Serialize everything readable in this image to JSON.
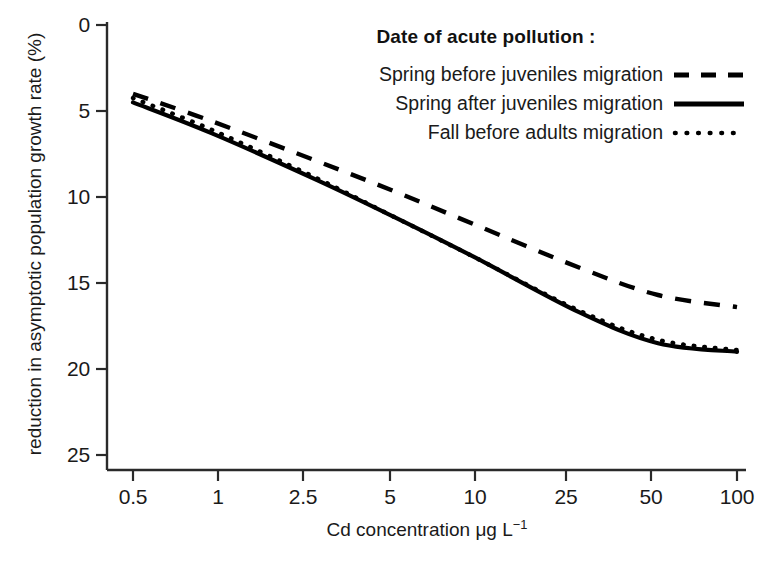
{
  "chart_data": {
    "type": "line",
    "title": "",
    "xlabel": "Cd concentration μg L⁻¹",
    "xlabel_base": "Cd concentration μg L",
    "xlabel_exponent": "−1",
    "ylabel": "reduction in asymptotic population growth rate (%)",
    "xscale": "log",
    "xlim": [
      0.5,
      100
    ],
    "ylim": [
      0,
      25
    ],
    "y_inverted": true,
    "grid": false,
    "legend_position": "top-right",
    "legend_title": "Date of acute pollution :",
    "xticks": [
      0.5,
      1,
      2.5,
      5,
      10,
      25,
      50,
      100
    ],
    "xtick_labels": [
      "0.5",
      "1",
      "2.5",
      "5",
      "10",
      "25",
      "50",
      "100"
    ],
    "yticks": [
      0,
      5,
      10,
      15,
      20,
      25
    ],
    "ytick_labels": [
      "0",
      "5",
      "10",
      "15",
      "20",
      "25"
    ],
    "x": [
      0.5,
      1,
      2.5,
      5,
      10,
      25,
      50,
      100
    ],
    "series": [
      {
        "name": "Spring before juveniles migration",
        "style": "dashed",
        "color": "#000000",
        "values": [
          4.0,
          5.6,
          7.9,
          9.7,
          11.6,
          14.1,
          15.7,
          16.4
        ]
      },
      {
        "name": "Spring after juveniles migration",
        "style": "solid",
        "color": "#000000",
        "values": [
          4.5,
          6.3,
          9.0,
          11.2,
          13.5,
          16.7,
          18.5,
          19.0
        ]
      },
      {
        "name": "Fall before adults migration",
        "style": "dotted",
        "color": "#000000",
        "values": [
          4.25,
          6.1,
          8.9,
          11.2,
          13.5,
          16.6,
          18.3,
          18.9
        ]
      }
    ]
  },
  "axes": {
    "y_title": "reduction in asymptotic population growth rate (%)",
    "x_title_base": "Cd concentration μg L",
    "x_title_sup": "−1",
    "ytick_labels": [
      "0",
      "5",
      "10",
      "15",
      "20",
      "25"
    ],
    "xtick_labels": [
      "0.5",
      "1",
      "2.5",
      "5",
      "10",
      "25",
      "50",
      "100"
    ]
  },
  "legend": {
    "title": "Date of acute pollution :",
    "items": [
      {
        "label": "Spring before juveniles migration",
        "style": "dashed"
      },
      {
        "label": "Spring after juveniles migration",
        "style": "solid"
      },
      {
        "label": "Fall before adults migration",
        "style": "dotted"
      }
    ]
  },
  "colors": {
    "ink": "#000000",
    "background": "#ffffff",
    "axis": "#2a2a2a"
  }
}
